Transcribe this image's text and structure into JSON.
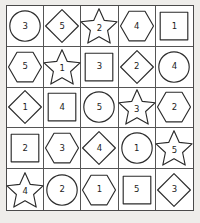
{
  "puzzle": {
    "title": "shape-number-grid",
    "rows": 5,
    "columns": 5,
    "colors": {
      "background": "#eeedea",
      "cell_fill": "#ffffff",
      "shape_stroke": "#2b2b2b",
      "grid_line": "#555555",
      "outer_border": "#4a4a4a",
      "number_text": "#1c1c1c"
    },
    "shape_names": [
      "circle",
      "diamond",
      "star",
      "hexagon",
      "square"
    ],
    "cells": [
      {
        "shape": "circle",
        "value": "3"
      },
      {
        "shape": "diamond",
        "value": "5"
      },
      {
        "shape": "star",
        "value": "2"
      },
      {
        "shape": "hexagon",
        "value": "4"
      },
      {
        "shape": "square",
        "value": "1"
      },
      {
        "shape": "hexagon",
        "value": "5"
      },
      {
        "shape": "star",
        "value": "1"
      },
      {
        "shape": "square",
        "value": "3"
      },
      {
        "shape": "diamond",
        "value": "2"
      },
      {
        "shape": "circle",
        "value": "4"
      },
      {
        "shape": "diamond",
        "value": "1"
      },
      {
        "shape": "square",
        "value": "4"
      },
      {
        "shape": "circle",
        "value": "5"
      },
      {
        "shape": "star",
        "value": "3"
      },
      {
        "shape": "hexagon",
        "value": "2"
      },
      {
        "shape": "square",
        "value": "2"
      },
      {
        "shape": "hexagon",
        "value": "3"
      },
      {
        "shape": "diamond",
        "value": "4"
      },
      {
        "shape": "circle",
        "value": "1"
      },
      {
        "shape": "star",
        "value": "5"
      },
      {
        "shape": "star",
        "value": "4"
      },
      {
        "shape": "circle",
        "value": "2"
      },
      {
        "shape": "hexagon",
        "value": "1"
      },
      {
        "shape": "square",
        "value": "5"
      },
      {
        "shape": "diamond",
        "value": "3"
      }
    ]
  }
}
